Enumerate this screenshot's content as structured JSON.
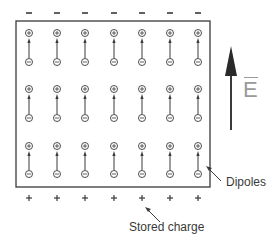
{
  "diagram": {
    "columns_x": [
      29,
      57,
      85,
      114,
      142,
      170,
      198
    ],
    "dipole_rows": [
      {
        "plus_y": 33,
        "minus_y": 62
      },
      {
        "plus_y": 89,
        "minus_y": 118
      },
      {
        "plus_y": 146,
        "minus_y": 174
      }
    ],
    "top_plate_charge": "−",
    "bottom_plate_charge": "+",
    "dipole_plus_symbol": "+",
    "dipole_minus_symbol": "−",
    "field_label": "E",
    "labels": {
      "dipoles": "Dipoles",
      "stored_charge": "Stored charge"
    },
    "colors": {
      "line": "#3a3a3a",
      "field_label": "#9a9a9a",
      "background": "#ffffff"
    }
  }
}
